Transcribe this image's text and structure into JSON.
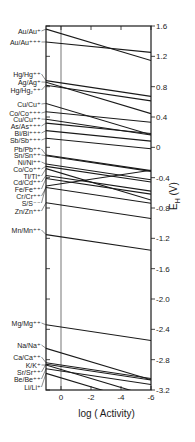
{
  "chart_data": {
    "type": "line",
    "title": "",
    "xlabel": "log ( Activity)",
    "ylabel": "E_H (V)",
    "ylabel_display": "E",
    "ylabel_sub": "H",
    "ylabel_unit": " (V)",
    "xlim": [
      1,
      -6
    ],
    "ylim": [
      -3.2,
      1.6
    ],
    "x_ticks": [
      0,
      -2,
      -4,
      -6
    ],
    "x_tick_labels": [
      "0",
      "-2",
      "-4",
      "-6"
    ],
    "y_ticks": [
      1.6,
      1.2,
      0.8,
      0.4,
      0,
      -0.4,
      -0.8,
      -1.2,
      -1.6,
      -2.0,
      -2.4,
      -2.8,
      -3.2
    ],
    "y_tick_labels": [
      "1.6",
      "1.2",
      "0.8",
      "0.4",
      "0",
      "-0.4",
      "-0.8",
      "-1.2",
      "-1.6",
      "-2.0",
      "-2.4",
      "-2.8",
      "-3.2"
    ],
    "grid": false,
    "reference_line_x": 0,
    "x": [
      1,
      -6
    ],
    "series": [
      {
        "name": "Au/Au⁺",
        "E0": 1.5,
        "n": 1,
        "label_y": 31
      },
      {
        "name": "Au/Au⁺⁺⁺",
        "E0": 1.37,
        "n": 3,
        "label_y": 42
      },
      {
        "name": "Hg/Hg⁺⁺",
        "E0": 0.85,
        "n": 2,
        "label_y": 74
      },
      {
        "name": "Ag/Ag⁺",
        "E0": 0.8,
        "n": 1,
        "label_y": 82
      },
      {
        "name": "Hg/Hg₂⁺⁺",
        "E0": 0.79,
        "n": 2,
        "label_y": 90
      },
      {
        "name": "Cu/Cu⁺",
        "E0": 0.52,
        "n": 1,
        "label_y": 104
      },
      {
        "name": "Co/Co⁺⁺⁺",
        "E0": 0.45,
        "n": 3,
        "label_y": 113
      },
      {
        "name": "Cu/Cu⁺⁺",
        "E0": 0.34,
        "n": 2,
        "label_y": 119
      },
      {
        "name": "As/As⁺⁺⁺",
        "E0": 0.3,
        "n": 3,
        "label_y": 126
      },
      {
        "name": "Bi/Bi⁺⁺⁺",
        "E0": 0.2,
        "n": 3,
        "label_y": 133
      },
      {
        "name": "Sb/Sb⁺⁺⁺",
        "E0": 0.1,
        "n": 3,
        "label_y": 140
      },
      {
        "name": "Pb/Pb⁺⁺",
        "E0": -0.13,
        "n": 2,
        "label_y": 149
      },
      {
        "name": "Sn/Sn⁺⁺",
        "E0": -0.14,
        "n": 2,
        "label_y": 155
      },
      {
        "name": "Ni/Ni⁺⁺",
        "E0": -0.25,
        "n": 2,
        "label_y": 162
      },
      {
        "name": "Co/Co⁺⁺",
        "E0": -0.28,
        "n": 2,
        "label_y": 169
      },
      {
        "name": "Tl/Tl⁺",
        "E0": -0.34,
        "n": 1,
        "label_y": 176
      },
      {
        "name": "Cd/Cd⁺⁺",
        "E0": -0.4,
        "n": 2,
        "label_y": 182
      },
      {
        "name": "Fe/Fe⁺⁺",
        "E0": -0.44,
        "n": 2,
        "label_y": 189
      },
      {
        "name": "Cr/Cr⁺⁺",
        "E0": -0.56,
        "n": 2,
        "label_y": 196
      },
      {
        "name": "S/S⁻⁻",
        "E0": -0.48,
        "n": -2,
        "label_y": 203
      },
      {
        "name": "Zn/Zn⁺⁺",
        "E0": -0.76,
        "n": 2,
        "label_y": 211
      },
      {
        "name": "Mn/Mn⁺⁺",
        "E0": -1.18,
        "n": 2,
        "label_y": 230
      },
      {
        "name": "Mg/Mg⁺⁺",
        "E0": -2.37,
        "n": 2,
        "label_y": 323
      },
      {
        "name": "Na/Na⁺",
        "E0": -2.71,
        "n": 1,
        "label_y": 345
      },
      {
        "name": "Ca/Ca⁺⁺",
        "E0": -2.87,
        "n": 2,
        "label_y": 357
      },
      {
        "name": "K/K⁺",
        "E0": -2.93,
        "n": 1,
        "label_y": 365
      },
      {
        "name": "Sr/Sr⁺⁺",
        "E0": -2.89,
        "n": 2,
        "label_y": 372
      },
      {
        "name": "Be/Be⁺⁺",
        "E0": -2.95,
        "n": 2,
        "label_y": 379
      },
      {
        "name": "Li/Li⁺",
        "E0": -3.04,
        "n": 1,
        "label_y": 387
      }
    ],
    "line_color": "#1a1a1a"
  }
}
